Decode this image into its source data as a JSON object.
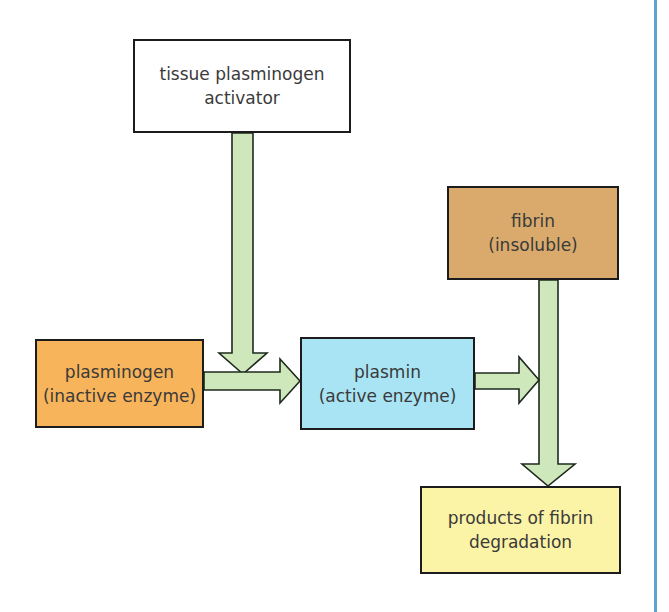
{
  "diagram": {
    "type": "flowchart",
    "colors": {
      "arrow_fill": "#cfe8bb",
      "arrow_stroke": "#1e2a1e",
      "box_border": "#1c1c1c",
      "text": "#3a3a3a",
      "side_rule": "#5aa3d6"
    },
    "nodes": [
      {
        "id": "tpa",
        "line1": "tissue plasminogen",
        "line2": "activator",
        "fill": "#ffffff"
      },
      {
        "id": "plasminogen",
        "line1": "plasminogen",
        "line2": "(inactive enzyme)",
        "fill": "#f8b45a"
      },
      {
        "id": "plasmin",
        "line1": "plasmin",
        "line2": "(active enzyme)",
        "fill": "#a8e4f4"
      },
      {
        "id": "fibrin",
        "line1": "fibrin",
        "line2": "(insoluble)",
        "fill": "#d9aa6c"
      },
      {
        "id": "products",
        "line1": "products of fibrin",
        "line2": "degradation",
        "fill": "#fbf3a6"
      }
    ],
    "edges": [
      {
        "from": "tpa",
        "to": "plasminogen-to-plasmin-arrow",
        "label": "activates conversion"
      },
      {
        "from": "plasminogen",
        "to": "plasmin",
        "label": ""
      },
      {
        "from": "plasmin",
        "to": "fibrin-to-products-arrow",
        "label": "acts on"
      },
      {
        "from": "fibrin",
        "to": "products",
        "label": ""
      }
    ]
  }
}
